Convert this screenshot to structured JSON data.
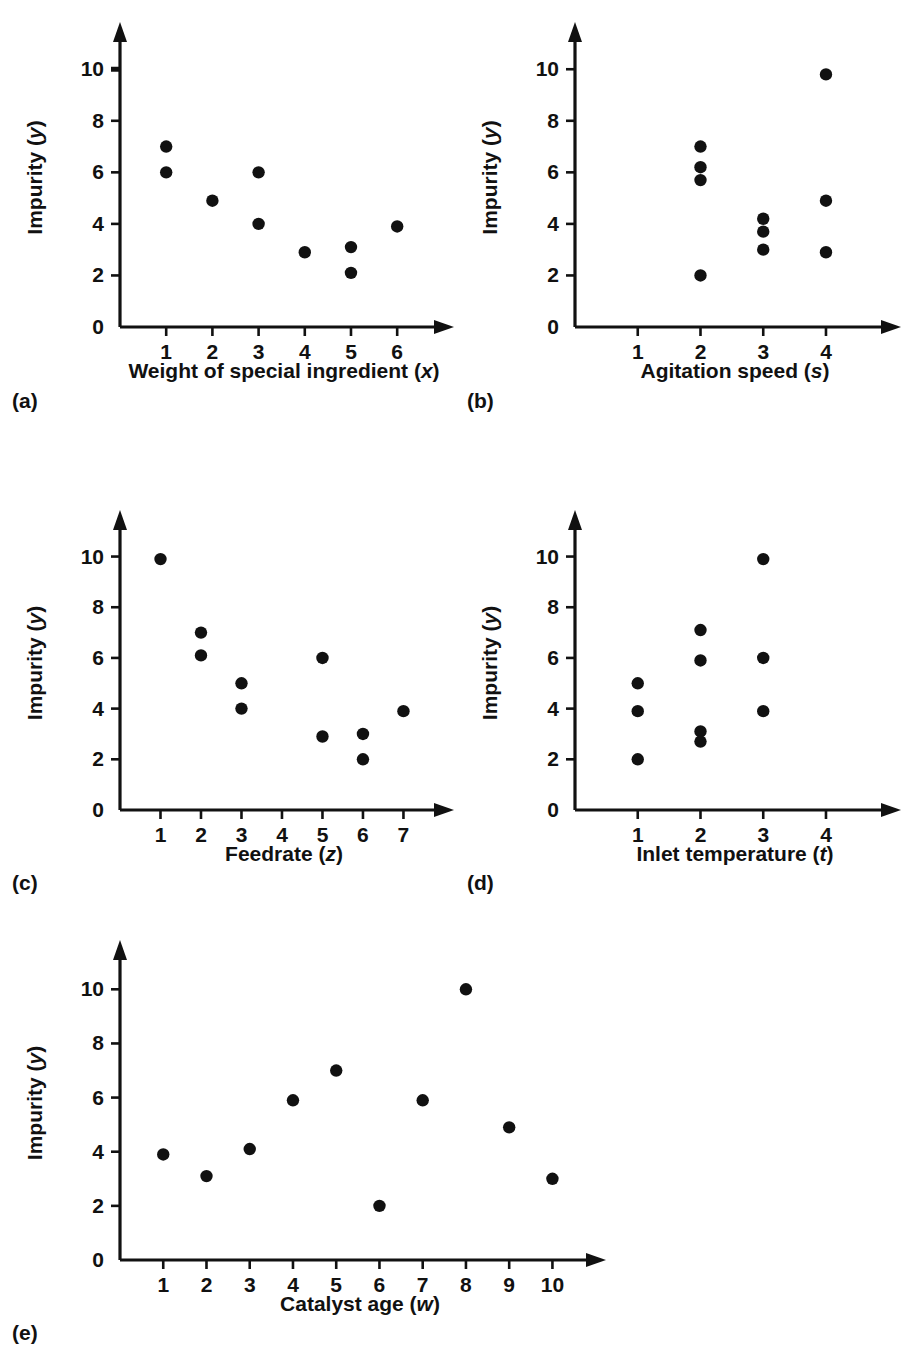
{
  "figure": {
    "background_color": "#ffffff",
    "ink_color": "#111111",
    "shared_y_axis_label_text": "Impurity",
    "shared_y_axis_label_variable": "y"
  },
  "panels": [
    {
      "letter": "(a)",
      "x_axis_label_text": "Weight of special ingredient",
      "x_axis_label_variable": "x",
      "y_axis_label_text": "Impurity",
      "y_axis_label_variable": "y",
      "x_tick_labels": [
        "1",
        "2",
        "3",
        "4",
        "5",
        "6"
      ],
      "y_tick_labels": [
        "0",
        "2",
        "4",
        "6",
        "8",
        "10"
      ]
    },
    {
      "letter": "(b)",
      "x_axis_label_text": "Agitation speed",
      "x_axis_label_variable": "s",
      "y_axis_label_text": "Impurity",
      "y_axis_label_variable": "y",
      "x_tick_labels": [
        "1",
        "2",
        "3",
        "4"
      ],
      "y_tick_labels": [
        "0",
        "2",
        "4",
        "6",
        "8",
        "10"
      ]
    },
    {
      "letter": "(c)",
      "x_axis_label_text": "Feedrate",
      "x_axis_label_variable": "z",
      "y_axis_label_text": "Impurity",
      "y_axis_label_variable": "y",
      "x_tick_labels": [
        "1",
        "2",
        "3",
        "4",
        "5",
        "6",
        "7"
      ],
      "y_tick_labels": [
        "0",
        "2",
        "4",
        "6",
        "8",
        "10"
      ]
    },
    {
      "letter": "(d)",
      "x_axis_label_text": "Inlet temperature",
      "x_axis_label_variable": "t",
      "y_axis_label_text": "Impurity",
      "y_axis_label_variable": "y",
      "x_tick_labels": [
        "1",
        "2",
        "3",
        "4"
      ],
      "y_tick_labels": [
        "0",
        "2",
        "4",
        "6",
        "8",
        "10"
      ]
    },
    {
      "letter": "(e)",
      "x_axis_label_text": "Catalyst age",
      "x_axis_label_variable": "w",
      "y_axis_label_text": "Impurity",
      "y_axis_label_variable": "y",
      "x_tick_labels": [
        "1",
        "2",
        "3",
        "4",
        "5",
        "6",
        "7",
        "8",
        "9",
        "10"
      ],
      "y_tick_labels": [
        "0",
        "2",
        "4",
        "6",
        "8",
        "10"
      ]
    }
  ],
  "chart_data": [
    {
      "type": "scatter",
      "panel": "(a)",
      "title": "",
      "xlabel": "Weight of special ingredient (x)",
      "ylabel": "Impurity (y)",
      "xlim": [
        0,
        7.1
      ],
      "ylim": [
        0,
        11.6
      ],
      "xticks": [
        1,
        2,
        3,
        4,
        5,
        6
      ],
      "yticks": [
        0,
        2,
        4,
        6,
        8,
        10
      ],
      "grid": false,
      "legend": null,
      "x": [
        1,
        1,
        2,
        3,
        3,
        4,
        5,
        5,
        6
      ],
      "y": [
        7,
        6,
        4.9,
        6,
        4,
        2.9,
        3.1,
        2.1,
        3.9
      ]
    },
    {
      "type": "scatter",
      "panel": "(b)",
      "title": "",
      "xlabel": "Agitation speed (s)",
      "ylabel": "Impurity (y)",
      "xlim": [
        0,
        5.1
      ],
      "ylim": [
        0,
        11.6
      ],
      "xticks": [
        1,
        2,
        3,
        4
      ],
      "yticks": [
        0,
        2,
        4,
        6,
        8,
        10
      ],
      "grid": false,
      "legend": null,
      "x": [
        2,
        2,
        2,
        2,
        3,
        3,
        3,
        4,
        4,
        4
      ],
      "y": [
        7,
        6.2,
        5.7,
        2,
        4.2,
        3.7,
        3.0,
        9.8,
        4.9,
        2.9
      ]
    },
    {
      "type": "scatter",
      "panel": "(c)",
      "title": "",
      "xlabel": "Feedrate (z)",
      "ylabel": "Impurity (y)",
      "xlim": [
        0,
        8.1
      ],
      "ylim": [
        0,
        11.6
      ],
      "xticks": [
        1,
        2,
        3,
        4,
        5,
        6,
        7
      ],
      "yticks": [
        0,
        2,
        4,
        6,
        8,
        10
      ],
      "grid": false,
      "legend": null,
      "x": [
        1,
        2,
        2,
        3,
        3,
        5,
        5,
        6,
        6,
        7
      ],
      "y": [
        9.9,
        7,
        6.1,
        5,
        4,
        6,
        2.9,
        3,
        2,
        3.9
      ]
    },
    {
      "type": "scatter",
      "panel": "(d)",
      "title": "",
      "xlabel": "Inlet temperature (t)",
      "ylabel": "Impurity (y)",
      "xlim": [
        0,
        5.1
      ],
      "ylim": [
        0,
        11.6
      ],
      "xticks": [
        1,
        2,
        3,
        4
      ],
      "yticks": [
        0,
        2,
        4,
        6,
        8,
        10
      ],
      "grid": false,
      "legend": null,
      "x": [
        1,
        1,
        1,
        2,
        2,
        2,
        2,
        3,
        3,
        3
      ],
      "y": [
        5,
        3.9,
        2,
        7.1,
        5.9,
        3.1,
        2.7,
        9.9,
        6,
        3.9
      ]
    },
    {
      "type": "scatter",
      "panel": "(e)",
      "title": "",
      "xlabel": "Catalyst age (w)",
      "ylabel": "Impurity (y)",
      "xlim": [
        0,
        11.1
      ],
      "ylim": [
        0,
        11.6
      ],
      "xticks": [
        1,
        2,
        3,
        4,
        5,
        6,
        7,
        8,
        9,
        10
      ],
      "yticks": [
        0,
        2,
        4,
        6,
        8,
        10
      ],
      "grid": false,
      "legend": null,
      "x": [
        1,
        2,
        3,
        4,
        5,
        6,
        7,
        8,
        9,
        10
      ],
      "y": [
        3.9,
        3.1,
        4.1,
        5.9,
        7,
        2,
        5.9,
        10,
        4.9,
        3
      ]
    }
  ]
}
